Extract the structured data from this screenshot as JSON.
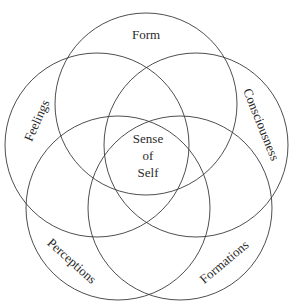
{
  "diagram": {
    "type": "five-circle-venn",
    "stroke_color": "#3a3a3a",
    "text_color": "#2a2a2a",
    "background": "#ffffff",
    "circles": [
      {
        "id": "form",
        "label": "Form",
        "cx": 146,
        "cy": 104,
        "r": 91,
        "label_x": 146,
        "label_y": 36,
        "label_rotate": 0
      },
      {
        "id": "feelings",
        "label": "Feelings",
        "cx": 97,
        "cy": 145,
        "r": 92,
        "label_x": 38,
        "label_y": 121,
        "label_rotate": -66
      },
      {
        "id": "consciousness",
        "label": "Consciousness",
        "cx": 196,
        "cy": 145,
        "r": 92,
        "label_x": 260,
        "label_y": 125,
        "label_rotate": 68
      },
      {
        "id": "perceptions",
        "label": "Perceptions",
        "cx": 118,
        "cy": 208,
        "r": 92,
        "label_x": 71,
        "label_y": 262,
        "label_rotate": 42
      },
      {
        "id": "formations",
        "label": "Formations",
        "cx": 180,
        "cy": 208,
        "r": 92,
        "label_x": 225,
        "label_y": 263,
        "label_rotate": -40
      }
    ],
    "center_label": {
      "lines": [
        "Sense",
        "of",
        "Self"
      ],
      "x": 148,
      "y_lines": [
        140,
        157,
        174
      ]
    }
  }
}
